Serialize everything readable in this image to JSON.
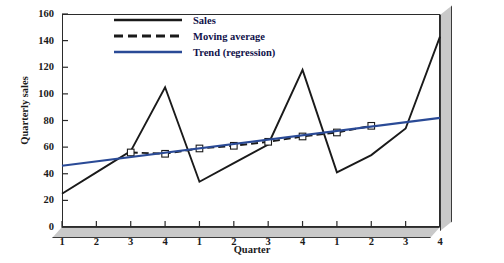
{
  "chart_data": {
    "type": "line",
    "title": "",
    "xlabel": "Quarter",
    "ylabel": "Quarterly sales",
    "ylim": [
      0,
      160
    ],
    "ytick_step": 20,
    "yticks": [
      0,
      20,
      40,
      60,
      80,
      100,
      120,
      140,
      160
    ],
    "xticks": [
      1,
      2,
      3,
      4,
      1,
      2,
      3,
      4,
      1,
      2,
      3,
      4
    ],
    "xtick_labels": [
      "1",
      "2",
      "3",
      "4",
      "1",
      "2",
      "3",
      "4",
      "1",
      "2",
      "3",
      "4"
    ],
    "grid": false,
    "legend_position": "top-center",
    "series": [
      {
        "name": "Sales",
        "style": "solid",
        "color": "#1a1a1a",
        "marker": "none",
        "x": [
          1,
          2,
          3,
          4,
          5,
          6,
          7,
          8,
          9,
          10,
          11,
          12
        ],
        "values": [
          25,
          41,
          57,
          105,
          34,
          48,
          62,
          118,
          41,
          54,
          74,
          143
        ]
      },
      {
        "name": "Moving average",
        "style": "dashed",
        "color": "#1a1a1a",
        "marker": "open-square",
        "x": [
          3,
          4,
          5,
          6,
          7,
          8,
          9,
          10
        ],
        "values": [
          56,
          55,
          59,
          61,
          64,
          68,
          71,
          76
        ]
      },
      {
        "name": "Trend (regression)",
        "style": "solid",
        "color": "#2a4a96",
        "marker": "none",
        "x": [
          1,
          12
        ],
        "values": [
          46,
          82
        ]
      }
    ]
  },
  "legend": {
    "items": [
      {
        "label": "Sales",
        "key": "solid-black-line-key"
      },
      {
        "label": "Moving average",
        "key": "dashed-black-line-key"
      },
      {
        "label": "Trend (regression)",
        "key": "solid-blue-line-key"
      }
    ]
  },
  "colors": {
    "sales": "#1a1a1a",
    "moving_average": "#1a1a1a",
    "trend": "#2a4a96",
    "frame": "#2b2b2b",
    "frame_shadow": "#c9c9c9",
    "legend_text": "#11124a"
  }
}
